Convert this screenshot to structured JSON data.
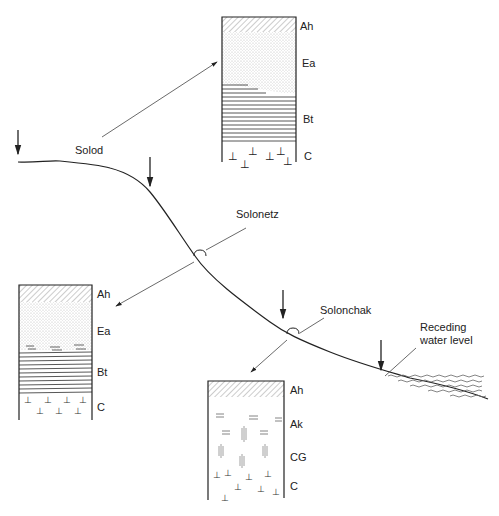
{
  "diagram": {
    "profiles": {
      "solod": {
        "name": "Solod",
        "horizons": [
          "Ah",
          "Ea",
          "Bt",
          "C"
        ]
      },
      "solonetz": {
        "name": "Solonetz",
        "horizons": [
          "Ah",
          "Ea",
          "Bt",
          "C"
        ]
      },
      "solonchak": {
        "name": "Solonchak",
        "horizons": [
          "Ah",
          "Ak",
          "CG",
          "C"
        ]
      }
    },
    "water_label_line1": "Receding",
    "water_label_line2": "water level",
    "colors": {
      "line": "#222222",
      "hatch": "#888888",
      "stipple": "#bbbbbb"
    }
  }
}
